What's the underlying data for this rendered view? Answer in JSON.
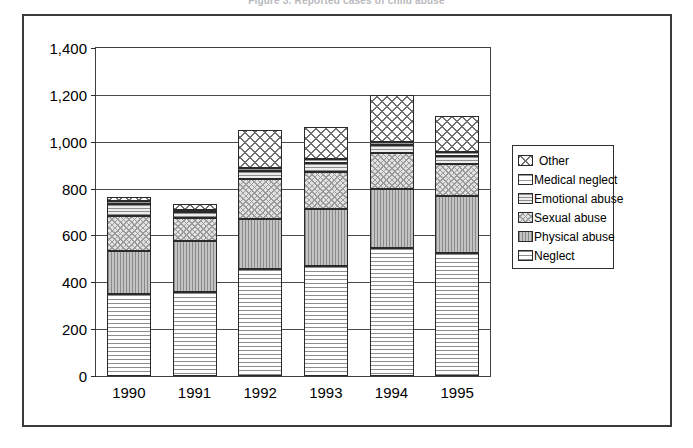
{
  "figure": {
    "title": "Figure 3.  Reported cases of child abuse"
  },
  "legend": {
    "position": "right",
    "items": [
      {
        "key": "other",
        "label": "Other",
        "swatch": "pat-other"
      },
      {
        "key": "medical",
        "label": "Medical neglect",
        "swatch": "pat-medical"
      },
      {
        "key": "emotional",
        "label": "Emotional abuse",
        "swatch": "pat-emotional"
      },
      {
        "key": "sexual",
        "label": "Sexual abuse",
        "swatch": "pat-sexual"
      },
      {
        "key": "physical",
        "label": "Physical abuse",
        "swatch": "pat-physical"
      },
      {
        "key": "neglect",
        "label": "Neglect",
        "swatch": "pat-neglect"
      }
    ]
  },
  "chart_data": {
    "type": "bar",
    "subtype": "stacked-vertical",
    "title": "",
    "xlabel": "",
    "ylabel": "",
    "categories": [
      "1990",
      "1991",
      "1992",
      "1993",
      "1994",
      "1995"
    ],
    "ylim": [
      0,
      1400
    ],
    "ytick_values": [
      0,
      200,
      400,
      600,
      800,
      1000,
      1200,
      1400
    ],
    "ytick_labels": [
      "0",
      "200",
      "400",
      "600",
      "800",
      "1,000",
      "1,200",
      "1,400"
    ],
    "grid": true,
    "grid_axis": "y",
    "legend_position": "right",
    "stack_order_bottom_to_top": [
      "neglect",
      "physical",
      "sexual",
      "emotional",
      "medical",
      "other"
    ],
    "series": [
      {
        "name": "Neglect",
        "key": "neglect",
        "pattern": "pat-neglect",
        "values": [
          350,
          360,
          455,
          470,
          545,
          525
        ]
      },
      {
        "name": "Physical abuse",
        "key": "physical",
        "pattern": "pat-physical",
        "values": [
          185,
          215,
          215,
          245,
          255,
          245
        ]
      },
      {
        "name": "Sexual abuse",
        "key": "sexual",
        "pattern": "pat-sexual",
        "values": [
          150,
          100,
          170,
          155,
          150,
          135
        ]
      },
      {
        "name": "Emotional abuse",
        "key": "emotional",
        "pattern": "pat-emotional",
        "values": [
          50,
          25,
          35,
          40,
          35,
          35
        ]
      },
      {
        "name": "Medical neglect",
        "key": "medical",
        "pattern": "pat-medical",
        "values": [
          10,
          10,
          15,
          15,
          15,
          15
        ]
      },
      {
        "name": "Other",
        "key": "other",
        "pattern": "pat-other",
        "values": [
          20,
          25,
          160,
          140,
          200,
          155
        ]
      }
    ],
    "totals": [
      765,
      735,
      1050,
      1065,
      1200,
      1110
    ]
  }
}
